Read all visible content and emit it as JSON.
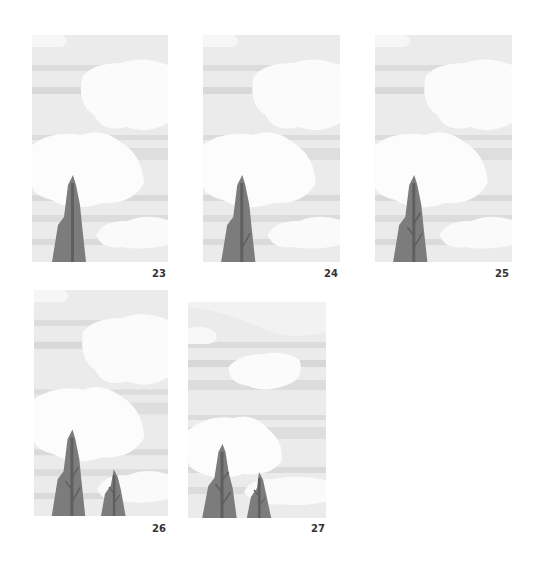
{
  "frames": [
    {
      "label": "23",
      "trees": 1,
      "branches": 0
    },
    {
      "label": "24",
      "trees": 1,
      "branches": 1
    },
    {
      "label": "25",
      "trees": 1,
      "branches": 3
    },
    {
      "label": "26",
      "trees": 2,
      "branches": 3
    },
    {
      "label": "27",
      "trees": 2,
      "branches": 3
    }
  ],
  "colors": {
    "sky": "#e9e9e9",
    "stripe": "#dadada",
    "cloud": "#fafafa",
    "tree": "#7d7d7d",
    "trunk": "#5e5e5e",
    "label": "#333333"
  }
}
